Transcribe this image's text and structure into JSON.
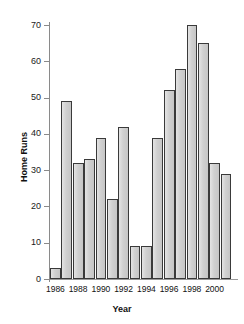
{
  "chart_data": {
    "type": "bar",
    "title": "",
    "xlabel": "Year",
    "ylabel": "Home Runs",
    "categories": [
      1986,
      1987,
      1988,
      1989,
      1990,
      1991,
      1992,
      1993,
      1994,
      1995,
      1996,
      1997,
      1998,
      1999,
      2000,
      2001
    ],
    "values": [
      3,
      49,
      32,
      33,
      39,
      22,
      42,
      9,
      9,
      39,
      52,
      58,
      70,
      65,
      32,
      29
    ],
    "ylim": [
      0,
      72
    ],
    "yticks": [
      0,
      10,
      20,
      30,
      40,
      50,
      60,
      70
    ],
    "ytick_labels": [
      "0",
      "10",
      "20",
      "30",
      "40",
      "50",
      "60",
      "70"
    ],
    "xtick_labels": [
      "1986",
      "1988",
      "1990",
      "1992",
      "1994",
      "1996",
      "1998",
      "2000"
    ],
    "xtick_categories": [
      1986,
      1988,
      1990,
      1992,
      1994,
      1996,
      1998,
      2000
    ],
    "grid": false,
    "legend": null,
    "bar_fill_color": "#d2d2d2",
    "bar_edge_color": "#3a3a3a",
    "axis_color": "#8a8a8a",
    "text_color": "#111111"
  }
}
